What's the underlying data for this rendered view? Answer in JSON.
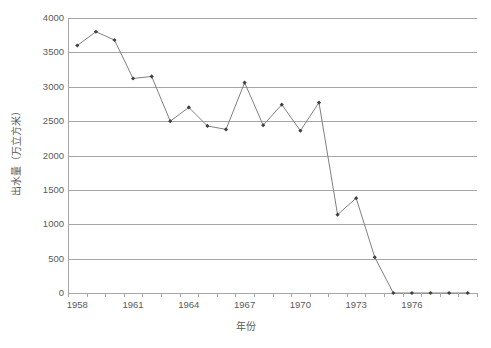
{
  "chart_data": {
    "type": "line",
    "title": "",
    "xlabel": "年份",
    "ylabel": "出水量（万立方米）",
    "x": [
      1958,
      1959,
      1960,
      1961,
      1962,
      1963,
      1964,
      1965,
      1966,
      1967,
      1968,
      1969,
      1970,
      1971,
      1972,
      1973,
      1974,
      1975,
      1976,
      1977,
      1978,
      1979
    ],
    "values": [
      3600,
      3800,
      3680,
      3120,
      3150,
      2500,
      2700,
      2430,
      2380,
      3060,
      2440,
      2740,
      2360,
      2770,
      1140,
      1380,
      520,
      0,
      0,
      0,
      0,
      0
    ],
    "series": [
      {
        "name": "出水量",
        "values": [
          3600,
          3800,
          3680,
          3120,
          3150,
          2500,
          2700,
          2430,
          2380,
          3060,
          2440,
          2740,
          2360,
          2770,
          1140,
          1380,
          520,
          0,
          0,
          0,
          0,
          0
        ]
      }
    ],
    "ylim": [
      0,
      4000
    ],
    "y_ticks": [
      0,
      500,
      1000,
      1500,
      2000,
      2500,
      3000,
      3500,
      4000
    ],
    "y_tick_labels": [
      "0",
      "500",
      "1000",
      "1500",
      "2000",
      "2500",
      "3000",
      "3500",
      "4000"
    ],
    "x_tick_labels": [
      "1958",
      "1961",
      "1964",
      "1967",
      "1970",
      "1973",
      "1976"
    ],
    "x_tick_label_values": [
      1958,
      1961,
      1964,
      1967,
      1970,
      1973,
      1976
    ],
    "grid": true,
    "grid_axis": "y",
    "legend": false,
    "legend_position": "none",
    "line_color": "#808080",
    "marker_color": "#404040",
    "marker_shape": "diamond",
    "gridline_color": "#a6a6a6",
    "text_color": "#5a5a5a",
    "background_color": "#ffffff"
  }
}
